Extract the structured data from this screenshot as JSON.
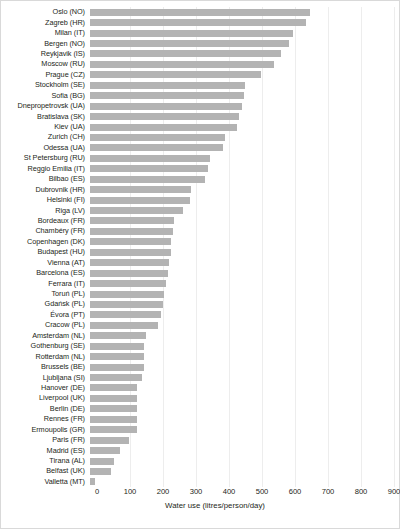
{
  "chart_data": {
    "type": "bar",
    "orientation": "horizontal",
    "title": "",
    "xlabel": "Water use (litres/person/day)",
    "ylabel": "",
    "xlim": [
      0,
      900
    ],
    "xticks": [
      0,
      100,
      200,
      300,
      400,
      500,
      600,
      700,
      800,
      900
    ],
    "grid": "vertical",
    "legend": "none",
    "bar_color": "#b3b3b3",
    "categories": [
      "Oslo (NO)",
      "Zagreb (HR)",
      "Milan (IT)",
      "Bergen (NO)",
      "Reykjavik (IS)",
      "Moscow (RU)",
      "Prague (CZ)",
      "Stockholm (SE)",
      "Sofia (BG)",
      "Dnepropetrovsk (UA)",
      "Bratislava (SK)",
      "Kiev (UA)",
      "Zurich (CH)",
      "Odessa (UA)",
      "St Petersburg (RU)",
      "Reggio Emilia (IT)",
      "Bilbao (ES)",
      "Dubrovnik (HR)",
      "Helsinki (FI)",
      "Riga (LV)",
      "Bordeaux (FR)",
      "Chambéry (FR)",
      "Copenhagen (DK)",
      "Budapest (HU)",
      "Vienna (AT)",
      "Barcelona (ES)",
      "Ferrara (IT)",
      "Toruń (PL)",
      "Gdańsk (PL)",
      "Évora (PT)",
      "Cracow (PL)",
      "Amsterdam (NL)",
      "Gothenburg (SE)",
      "Rotterdam (NL)",
      "Brussels (BE)",
      "Ljubljana (SI)",
      "Hanover (DE)",
      "Liverpool (UK)",
      "Berlin (DE)",
      "Rennes (FR)",
      "Ermoupolis (GR)",
      "Paris (FR)",
      "Madrid (ES)",
      "Tirana (AL)",
      "Belfast (UK)",
      "Valletta (MT)"
    ],
    "values": [
      651,
      640,
      600,
      590,
      565,
      545,
      505,
      460,
      455,
      450,
      440,
      435,
      400,
      395,
      355,
      350,
      340,
      300,
      295,
      275,
      250,
      245,
      240,
      240,
      235,
      230,
      225,
      220,
      215,
      210,
      200,
      165,
      160,
      160,
      160,
      155,
      140,
      140,
      140,
      140,
      140,
      115,
      90,
      70,
      62,
      15
    ],
    "units": "litres/person/day"
  },
  "axis": {
    "x_title": "Water use (litres/person/day)",
    "tick_labels": [
      "0",
      "100",
      "200",
      "300",
      "400",
      "500",
      "600",
      "700",
      "800",
      "900"
    ]
  }
}
